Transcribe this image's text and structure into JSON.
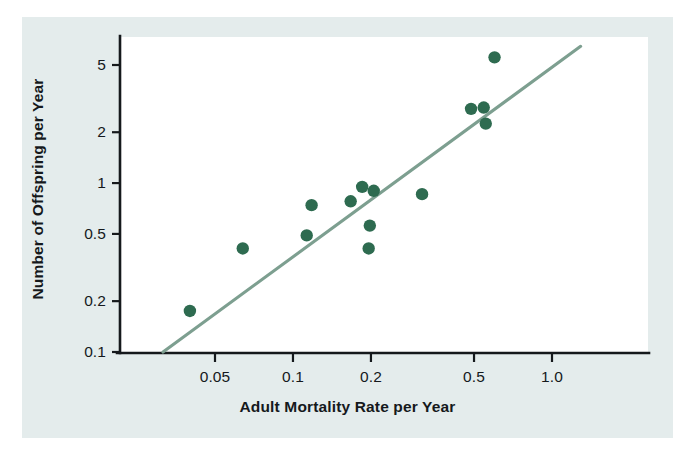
{
  "chart_data": {
    "type": "scatter",
    "title": "",
    "xlabel": "Adult Mortality Rate per Year",
    "ylabel": "Number of Offspring per Year",
    "xscale": "log",
    "yscale": "log",
    "xlim": [
      0.031,
      1.3
    ],
    "ylim": [
      0.1,
      7.0
    ],
    "grid": false,
    "legend": null,
    "xticks": [
      {
        "value": 0.05,
        "label": "0.05"
      },
      {
        "value": 0.1,
        "label": "0.1"
      },
      {
        "value": 0.2,
        "label": "0.2"
      },
      {
        "value": 0.5,
        "label": "0.5"
      },
      {
        "value": 1.0,
        "label": "1.0"
      }
    ],
    "yticks": [
      {
        "value": 5,
        "label": "5"
      },
      {
        "value": 2,
        "label": "2"
      },
      {
        "value": 1,
        "label": "1"
      },
      {
        "value": 0.5,
        "label": "0.5"
      },
      {
        "value": 0.2,
        "label": "0.2"
      },
      {
        "value": 0.1,
        "label": "0.1"
      }
    ],
    "series": [
      {
        "name": "species",
        "marker": "circle",
        "color": "#2e6b50",
        "points": [
          {
            "x": 0.04,
            "y": 0.175
          },
          {
            "x": 0.064,
            "y": 0.41
          },
          {
            "x": 0.113,
            "y": 0.49
          },
          {
            "x": 0.118,
            "y": 0.74
          },
          {
            "x": 0.167,
            "y": 0.78
          },
          {
            "x": 0.185,
            "y": 0.95
          },
          {
            "x": 0.196,
            "y": 0.41
          },
          {
            "x": 0.198,
            "y": 0.56
          },
          {
            "x": 0.205,
            "y": 0.9
          },
          {
            "x": 0.315,
            "y": 0.86
          },
          {
            "x": 0.487,
            "y": 2.75
          },
          {
            "x": 0.545,
            "y": 2.8
          },
          {
            "x": 0.555,
            "y": 2.25
          },
          {
            "x": 0.6,
            "y": 5.55
          }
        ]
      }
    ],
    "trend_line": {
      "name": "fitted-regression-line",
      "color": "#7d9f90",
      "start": {
        "x": 0.0315,
        "y": 0.1
      },
      "end": {
        "x": 1.29,
        "y": 6.45
      }
    }
  },
  "axes": {
    "x_title": "Adult Mortality Rate per Year",
    "y_title": "Number of Offspring per Year"
  }
}
